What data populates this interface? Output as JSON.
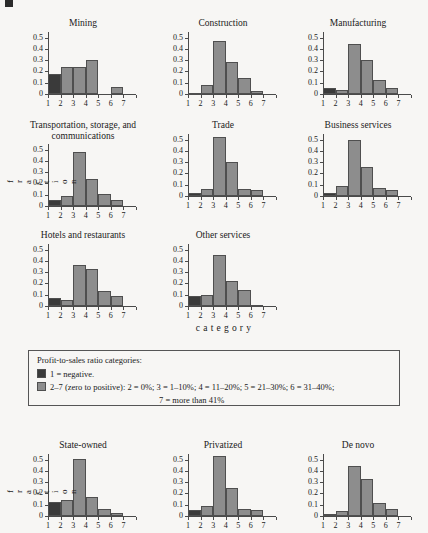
{
  "figure": {
    "y_axis_title": "fraction",
    "x_axis_title": "category",
    "y_ticks": [
      "0",
      "0.1",
      "0.2",
      "0.3",
      "0.4",
      "0.5"
    ],
    "x_ticks": [
      "1",
      "2",
      "3",
      "4",
      "5",
      "6",
      "7"
    ],
    "colors": {
      "negative_bar": "#3a3a3a",
      "positive_bar": "#8d8d8d",
      "axis": "#4a4a4a",
      "background": "#f7f6f4"
    }
  },
  "legend": {
    "title": "Profit-to-sales ratio categories:",
    "row1": "1 =  negative.",
    "row2": "2–7 (zero to positive):  2 = 0%; 3 = 1–10%; 4 = 11–20%; 5 = 21–30%; 6 = 31–40%;",
    "row2_cont": "7 = more than 41%",
    "swatch1_color": "#3a3a3a",
    "swatch2_color": "#8d8d8d"
  },
  "chart_data": [
    {
      "type": "bar",
      "title": "Mining",
      "xlabel": "category",
      "ylabel": "fraction",
      "categories": [
        "1",
        "2",
        "3",
        "4",
        "5",
        "6",
        "7"
      ],
      "values": [
        0.18,
        0.24,
        0.24,
        0.3,
        0.0,
        0.06,
        0.0
      ],
      "ylim": [
        0,
        0.55
      ],
      "grid": false,
      "legend": "none"
    },
    {
      "type": "bar",
      "title": "Construction",
      "xlabel": "category",
      "ylabel": "fraction",
      "categories": [
        "1",
        "2",
        "3",
        "4",
        "5",
        "6",
        "7"
      ],
      "values": [
        0.01,
        0.08,
        0.47,
        0.28,
        0.14,
        0.03,
        0.0
      ],
      "ylim": [
        0,
        0.55
      ],
      "grid": false,
      "legend": "none"
    },
    {
      "type": "bar",
      "title": "Manufacturing",
      "xlabel": "category",
      "ylabel": "fraction",
      "categories": [
        "1",
        "2",
        "3",
        "4",
        "5",
        "6",
        "7"
      ],
      "values": [
        0.055,
        0.035,
        0.445,
        0.305,
        0.125,
        0.055,
        0.0
      ],
      "ylim": [
        0,
        0.55
      ],
      "grid": false,
      "legend": "none"
    },
    {
      "type": "bar",
      "title": "Transportation, storage, and communications",
      "xlabel": "category",
      "ylabel": "fraction",
      "categories": [
        "1",
        "2",
        "3",
        "4",
        "5",
        "6",
        "7"
      ],
      "values": [
        0.05,
        0.09,
        0.48,
        0.24,
        0.105,
        0.055,
        0.0
      ],
      "ylim": [
        0,
        0.55
      ],
      "grid": false,
      "legend": "none"
    },
    {
      "type": "bar",
      "title": "Trade",
      "xlabel": "category",
      "ylabel": "fraction",
      "categories": [
        "1",
        "2",
        "3",
        "4",
        "5",
        "6",
        "7"
      ],
      "values": [
        0.025,
        0.06,
        0.525,
        0.3,
        0.06,
        0.05,
        0.0
      ],
      "ylim": [
        0,
        0.55
      ],
      "grid": false,
      "legend": "none"
    },
    {
      "type": "bar",
      "title": "Business services",
      "xlabel": "category",
      "ylabel": "fraction",
      "categories": [
        "1",
        "2",
        "3",
        "4",
        "5",
        "6",
        "7"
      ],
      "values": [
        0.03,
        0.09,
        0.5,
        0.26,
        0.075,
        0.055,
        0.0
      ],
      "ylim": [
        0,
        0.55
      ],
      "grid": false,
      "legend": "none"
    },
    {
      "type": "bar",
      "title": "Hotels and restaurants",
      "xlabel": "category",
      "ylabel": "fraction",
      "categories": [
        "1",
        "2",
        "3",
        "4",
        "5",
        "6",
        "7"
      ],
      "values": [
        0.075,
        0.05,
        0.36,
        0.325,
        0.13,
        0.085,
        0.0
      ],
      "ylim": [
        0,
        0.55
      ],
      "grid": false,
      "legend": "none"
    },
    {
      "type": "bar",
      "title": "Other services",
      "xlabel": "category",
      "ylabel": "fraction",
      "categories": [
        "1",
        "2",
        "3",
        "4",
        "5",
        "6",
        "7"
      ],
      "values": [
        0.09,
        0.1,
        0.455,
        0.22,
        0.14,
        0.01,
        0.0
      ],
      "ylim": [
        0,
        0.55
      ],
      "grid": false,
      "legend": "none"
    },
    {
      "type": "bar",
      "title": "State-owned",
      "xlabel": "category",
      "ylabel": "fraction",
      "categories": [
        "1",
        "2",
        "3",
        "4",
        "5",
        "6",
        "7"
      ],
      "values": [
        0.125,
        0.14,
        0.505,
        0.165,
        0.065,
        0.025,
        0.0
      ],
      "ylim": [
        0,
        0.55
      ],
      "grid": false,
      "legend": "none"
    },
    {
      "type": "bar",
      "title": "Privatized",
      "xlabel": "category",
      "ylabel": "fraction",
      "categories": [
        "1",
        "2",
        "3",
        "4",
        "5",
        "6",
        "7"
      ],
      "values": [
        0.055,
        0.085,
        0.535,
        0.245,
        0.06,
        0.05,
        0.0
      ],
      "ylim": [
        0,
        0.55
      ],
      "grid": false,
      "legend": "none"
    },
    {
      "type": "bar",
      "title": "De novo",
      "xlabel": "category",
      "ylabel": "fraction",
      "categories": [
        "1",
        "2",
        "3",
        "4",
        "5",
        "6",
        "7"
      ],
      "values": [
        0.02,
        0.045,
        0.445,
        0.325,
        0.115,
        0.06,
        0.0
      ],
      "ylim": [
        0,
        0.55
      ],
      "grid": false,
      "legend": "none"
    }
  ],
  "panel_layout": [
    {
      "index": 0,
      "left": 26,
      "top": 18,
      "title_lines": 1
    },
    {
      "index": 1,
      "left": 166,
      "top": 18,
      "title_lines": 1
    },
    {
      "index": 2,
      "left": 301,
      "top": 18,
      "title_lines": 1
    },
    {
      "index": 3,
      "left": 26,
      "top": 120,
      "title_lines": 2
    },
    {
      "index": 4,
      "left": 166,
      "top": 120,
      "title_lines": 1
    },
    {
      "index": 5,
      "left": 301,
      "top": 120,
      "title_lines": 1
    },
    {
      "index": 6,
      "left": 26,
      "top": 230,
      "title_lines": 1
    },
    {
      "index": 7,
      "left": 166,
      "top": 230,
      "title_lines": 1
    },
    {
      "index": 8,
      "left": 26,
      "top": 440,
      "title_lines": 1
    },
    {
      "index": 9,
      "left": 166,
      "top": 440,
      "title_lines": 1
    },
    {
      "index": 10,
      "left": 301,
      "top": 440,
      "title_lines": 1
    }
  ],
  "axis_titles": [
    {
      "name": "fraction-top",
      "left": 8,
      "top": 138,
      "height": 88
    },
    {
      "name": "fraction-bottom",
      "left": 8,
      "top": 448,
      "height": 88
    },
    {
      "name": "category",
      "left": 160,
      "top": 322
    }
  ]
}
